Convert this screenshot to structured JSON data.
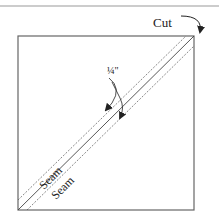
{
  "diagram": {
    "labels": {
      "cut": "Cut",
      "seam_allowance": "¼\"",
      "seam_upper": "Seam",
      "seam_lower": "Seam"
    },
    "colors": {
      "line": "#444444",
      "top_rule": "#999999",
      "background": "#ffffff"
    }
  }
}
